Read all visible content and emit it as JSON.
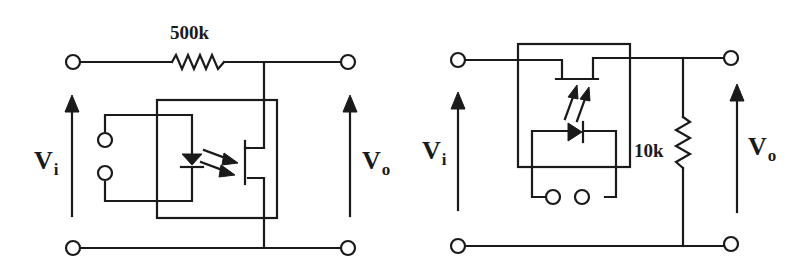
{
  "diagrams": [
    {
      "id": "left",
      "description": "Optocoupler with LED and photo-FET, series resistor to output",
      "resistor": {
        "label": "500k",
        "orientation": "horizontal"
      },
      "input_voltage": {
        "symbol": "V",
        "subscript": "i"
      },
      "output_voltage": {
        "symbol": "V",
        "subscript": "o"
      }
    },
    {
      "id": "right",
      "description": "Optocoupler with LED and photo-FET in series path, shunt resistor to ground",
      "resistor": {
        "label": "10k",
        "orientation": "vertical"
      },
      "input_voltage": {
        "symbol": "V",
        "subscript": "i"
      },
      "output_voltage": {
        "symbol": "V",
        "subscript": "o"
      }
    }
  ],
  "colors": {
    "line": "#1a1a1a",
    "background": "#ffffff"
  }
}
